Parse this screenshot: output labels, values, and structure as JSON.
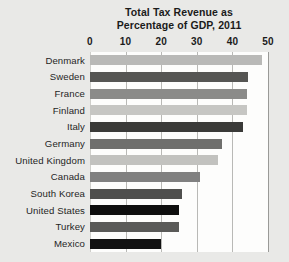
{
  "chart_data": {
    "type": "bar",
    "orientation": "horizontal",
    "title": "Total Tax Revenue as Percentage of GDP, 2011",
    "title_lines": [
      "Total Tax Revenue as",
      "Percentage of GDP, 2011"
    ],
    "xlabel": "",
    "ylabel": "",
    "xlim": [
      0,
      50
    ],
    "xticks": [
      0,
      10,
      20,
      30,
      40,
      50
    ],
    "xtick_labels": [
      "0",
      "10",
      "20",
      "30",
      "40",
      "50"
    ],
    "grid": true,
    "grid_axis": "x",
    "legend": "none",
    "categories": [
      "Denmark",
      "Sweden",
      "France",
      "Finland",
      "Italy",
      "Germany",
      "United Kingdom",
      "Canada",
      "South Korea",
      "United States",
      "Turkey",
      "Mexico"
    ],
    "values": [
      48.2,
      44.5,
      44.2,
      44.0,
      43.0,
      37.1,
      36.0,
      31.0,
      25.9,
      25.1,
      25.0,
      20.0
    ],
    "bar_colors": [
      "#b9b9b7",
      "#555553",
      "#8b8b89",
      "#c6c6c3",
      "#3a3a38",
      "#6f6f6d",
      "#c2c2bf",
      "#808080",
      "#4f4f4d",
      "#0f0f0f",
      "#5a5a58",
      "#121212"
    ],
    "plot_background": "#fdfdfc",
    "figure_background": "#e9e9e7",
    "gridline_color": "#b9b9b6",
    "text_color": "#1b1b1b"
  }
}
